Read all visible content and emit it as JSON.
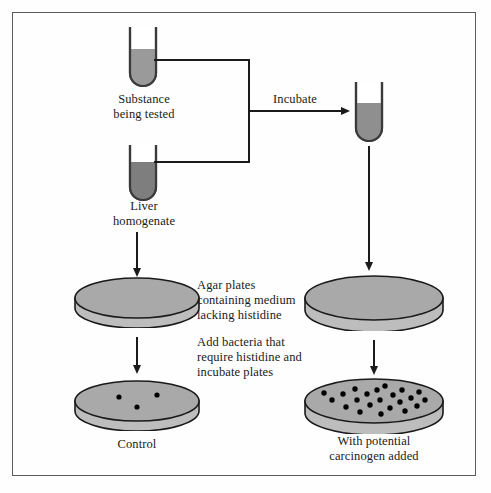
{
  "figure": {
    "background_color": "#fefefe",
    "border_color": "#5a5a5a"
  },
  "colors": {
    "stroke": "#1a1a1a",
    "tube_glass": "#3a3a3a",
    "substance_fill": "#9a9a9a",
    "homogenate_fill": "#7e7e7e",
    "mixture_fill": "#8f8f8f",
    "plate_top": "#a9a9a9",
    "plate_side": "#bdbdbd",
    "colony_dot": "#000000"
  },
  "labels": {
    "substance_being_tested": "Substance\nbeing tested",
    "liver_homogenate": "Liver\nhomogenate",
    "incubate": "Incubate",
    "agar_plates": "Agar plates\ncontaining medium\nlacking histidine",
    "add_bacteria": "Add bacteria that\nrequire histidine and\nincubate plates",
    "control": "Control",
    "with_carcinogen": "With potential\ncarcinogen added"
  },
  "tubes": [
    {
      "name": "substance-tube",
      "fill_label": "substance being tested",
      "fill_level_pct": 52
    },
    {
      "name": "liver-homogenate-tube",
      "fill_label": "liver homogenate",
      "fill_level_pct": 60
    },
    {
      "name": "incubated-mixture-tube",
      "fill_label": "incubated mixture",
      "fill_level_pct": 62
    }
  ],
  "plates": [
    {
      "name": "control-plate-empty",
      "colony_count": 0,
      "position": "left-upper",
      "size": "small"
    },
    {
      "name": "control-plate-result",
      "colony_count": 3,
      "position": "left-lower",
      "size": "small"
    },
    {
      "name": "test-plate-empty",
      "colony_count": 0,
      "position": "right-upper",
      "size": "large"
    },
    {
      "name": "test-plate-result",
      "colony_count": 22,
      "position": "right-lower",
      "size": "large"
    }
  ],
  "colonies": {
    "control": [
      {
        "x": 0.36,
        "y": 0.4
      },
      {
        "x": 0.66,
        "y": 0.36
      },
      {
        "x": 0.5,
        "y": 0.64
      }
    ],
    "test": [
      {
        "x": 0.2,
        "y": 0.47
      },
      {
        "x": 0.28,
        "y": 0.33
      },
      {
        "x": 0.3,
        "y": 0.62
      },
      {
        "x": 0.36,
        "y": 0.22
      },
      {
        "x": 0.38,
        "y": 0.45
      },
      {
        "x": 0.4,
        "y": 0.73
      },
      {
        "x": 0.45,
        "y": 0.34
      },
      {
        "x": 0.47,
        "y": 0.58
      },
      {
        "x": 0.52,
        "y": 0.25
      },
      {
        "x": 0.54,
        "y": 0.46
      },
      {
        "x": 0.55,
        "y": 0.8
      },
      {
        "x": 0.58,
        "y": 0.16
      },
      {
        "x": 0.61,
        "y": 0.64
      },
      {
        "x": 0.63,
        "y": 0.36
      },
      {
        "x": 0.68,
        "y": 0.5
      },
      {
        "x": 0.7,
        "y": 0.25
      },
      {
        "x": 0.72,
        "y": 0.72
      },
      {
        "x": 0.76,
        "y": 0.41
      },
      {
        "x": 0.8,
        "y": 0.58
      },
      {
        "x": 0.82,
        "y": 0.29
      },
      {
        "x": 0.86,
        "y": 0.46
      },
      {
        "x": 0.14,
        "y": 0.33
      }
    ]
  }
}
